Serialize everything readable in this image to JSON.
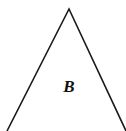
{
  "diagram": {
    "shape": "triangle",
    "label": "B",
    "stroke_color": "#1a1a1a",
    "apex": [
      69,
      9
    ],
    "left_base": [
      7,
      131
    ],
    "right_base": [
      126,
      131
    ]
  }
}
